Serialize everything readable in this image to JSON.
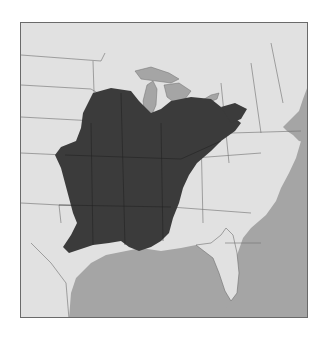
{
  "map": {
    "type": "species range map",
    "region": "Eastern United States",
    "watermark_text": "",
    "colors": {
      "land": "#e1e1e1",
      "water": "#a5a5a5",
      "range": "#3b3b3b",
      "borders": "#6e6e6e",
      "frame": "#6a6a6a"
    },
    "range_description": "Shaded distribution across central and southeastern United States, from Iowa/Illinois south to Louisiana and east to Ohio/Pennsylvania"
  }
}
